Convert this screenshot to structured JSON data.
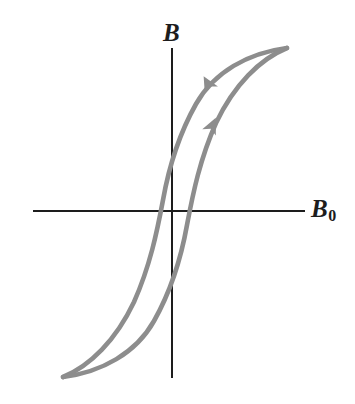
{
  "figure": {
    "kind": "hysteresis-loop-diagram",
    "title": "",
    "background_color": "#ffffff"
  },
  "axes": {
    "vertical": {
      "label": "B",
      "name": "magnetic-field-in-material",
      "color": "#1d1d1d",
      "x": 172,
      "y_top": 48,
      "y_bottom": 378
    },
    "horizontal": {
      "label": "B",
      "subscript": "0",
      "name": "applied-magnetic-field",
      "color": "#1d1d1d",
      "y": 211,
      "x_left": 33,
      "x_right": 305
    }
  },
  "curve": {
    "color": "#8d8d8d",
    "stroke_width": 4.6,
    "saturation_positive": {
      "x": 287,
      "y": 48
    },
    "saturation_negative": {
      "x": 63,
      "y": 377
    },
    "remanence_upper": {
      "x": 172,
      "y": 155
    },
    "remanence_lower": {
      "x": 172,
      "y": 268
    },
    "coercivity_left": {
      "x": 155,
      "y": 211
    },
    "coercivity_right": {
      "x": 185,
      "y": 211
    },
    "branches": [
      {
        "name": "descending-branch",
        "direction": "down-left",
        "path": "M 287 48 C 248 53, 214 72, 196 104 C 178 136, 168 172, 163 200 C 157 232, 150 266, 134 302 C 116 340, 90 366, 63 377"
      },
      {
        "name": "ascending-branch",
        "direction": "up-right",
        "path": "M 63 377 C 102 372, 136 353, 154 321 C 172 289, 182 253, 187 225 C 193 193, 200 159, 216 123 C 234 85, 260 59, 287 48"
      }
    ],
    "arrows": [
      {
        "name": "descending-arrow",
        "x": 208,
        "y": 84,
        "angle_deg": 241
      },
      {
        "name": "ascending-arrow",
        "x": 212,
        "y": 126,
        "angle_deg": 295
      }
    ]
  }
}
